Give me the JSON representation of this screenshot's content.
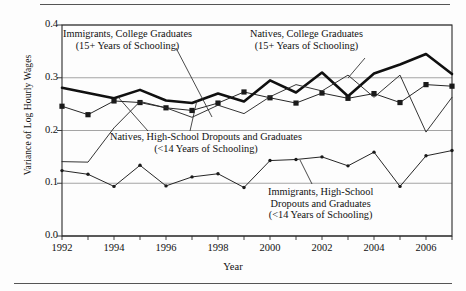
{
  "figure": {
    "ylabel": "Variance of Log Hourly Wages",
    "xlabel": "Year"
  },
  "annotations": {
    "immigrants_college": {
      "line1": "Immigrants, College Graduates",
      "line2": "(15+ Years of Schooling)"
    },
    "natives_college": {
      "line1": "Natives, College Graduates",
      "line2": "(15+ Years of Schooling)"
    },
    "natives_hs": {
      "line1": "Natives, High-School Dropouts and Graduates",
      "line2": "(<14 Years of Schooling)"
    },
    "immigrants_hs": {
      "line1": "Immigrants, High-School",
      "line2": "Dropouts and Graduates",
      "line3": "(<14 Years of Schooling)"
    }
  },
  "chart_data": {
    "type": "line",
    "title": "",
    "xlabel": "Year",
    "ylabel": "Variance of Log Hourly Wages",
    "xlim": [
      1992,
      2007
    ],
    "ylim": [
      0.0,
      0.4
    ],
    "yticks": [
      "0.0",
      "0.1",
      "0.2",
      "0.3",
      "0.4"
    ],
    "ytick_values": [
      0.0,
      0.1,
      0.2,
      0.3,
      0.4
    ],
    "xticks": [
      "1992",
      "1994",
      "1996",
      "1998",
      "2000",
      "2002",
      "2004",
      "2006"
    ],
    "xtick_values": [
      1992,
      1994,
      1996,
      1998,
      2000,
      2002,
      2004,
      2006
    ],
    "grid": "horizontal",
    "legend": "annotations-inline",
    "x": [
      1992,
      1993,
      1994,
      1995,
      1996,
      1997,
      1998,
      1999,
      2000,
      2001,
      2002,
      2003,
      2004,
      2005,
      2006,
      2007
    ],
    "series": [
      {
        "name": "Natives, College Graduates (15+ Years of Schooling)",
        "style": "thick-line-no-marker",
        "color": "#101010",
        "values": [
          0.281,
          0.271,
          0.261,
          0.277,
          0.257,
          0.252,
          0.27,
          0.255,
          0.295,
          0.272,
          0.31,
          0.265,
          0.308,
          0.325,
          0.345,
          0.307
        ]
      },
      {
        "name": "Natives, High-School Dropouts and Graduates (<14 Years of Schooling)",
        "style": "thin-line-square-marker",
        "color": "#1a1a1a",
        "values": [
          0.246,
          0.23,
          0.256,
          0.253,
          0.243,
          0.238,
          0.252,
          0.273,
          0.262,
          0.252,
          0.271,
          0.261,
          0.27,
          0.253,
          0.287,
          0.284
        ]
      },
      {
        "name": "Immigrants, College Graduates (15+ Years of Schooling)",
        "style": "thin-line-no-marker",
        "color": "#2a2a2a",
        "values": [
          0.141,
          0.14,
          0.205,
          0.255,
          0.243,
          0.225,
          0.248,
          0.232,
          0.264,
          0.287,
          0.275,
          0.305,
          0.263,
          0.305,
          0.197,
          0.263
        ]
      },
      {
        "name": "Immigrants, High-School Dropouts and Graduates (<14 Years of Schooling)",
        "style": "thin-line-dot-marker",
        "color": "#1a1a1a",
        "values": [
          0.124,
          0.117,
          0.094,
          0.134,
          0.095,
          0.112,
          0.118,
          0.092,
          0.143,
          0.145,
          0.15,
          0.133,
          0.159,
          0.094,
          0.152,
          0.162
        ]
      }
    ]
  }
}
